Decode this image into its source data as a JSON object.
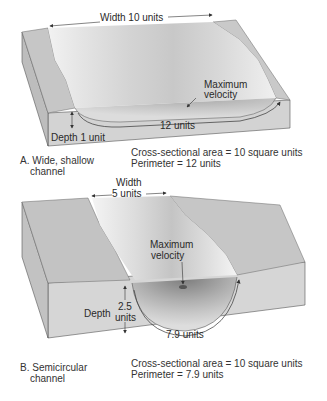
{
  "panel_a": {
    "width_label": "Width 10 units",
    "max_velocity_label_1": "Maximum",
    "max_velocity_label_2": "velocity",
    "perimeter_arrow_label": "12 units",
    "depth_label": "Depth 1 unit",
    "caption_line1": "A. Wide, shallow",
    "caption_line2": "channel",
    "area_text": "Cross-sectional area = 10 square units",
    "perimeter_text": "Perimeter = 12 units"
  },
  "panel_b": {
    "width_label_1": "Width",
    "width_label_2": "5 units",
    "max_velocity_label_1": "Maximum",
    "max_velocity_label_2": "velocity",
    "depth_label": "Depth",
    "depth_value_1": "2.5",
    "depth_value_2": "units",
    "perimeter_arrow_label": "7.9 units",
    "caption_line1": "B. Semicircular",
    "caption_line2": "channel",
    "area_text": "Cross-sectional area = 10 square units",
    "perimeter_text": "Perimeter = 7.9 units"
  },
  "colors": {
    "block_top": "#c9c9c9",
    "block_side": "#d6d6d6",
    "water_light": "#eeeeee",
    "water_dark": "#b5b5b5",
    "outline": "#444444"
  }
}
